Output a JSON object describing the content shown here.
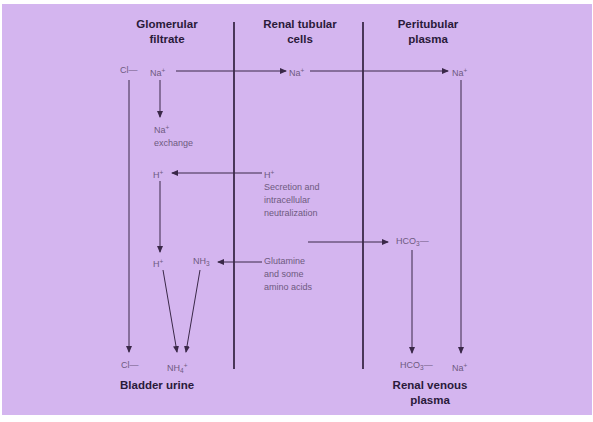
{
  "columns": {
    "glomerular": "Glomerular filtrate",
    "glomerular_l1": "Glomerular",
    "glomerular_l2": "filtrate",
    "tubular_l1": "Renal tubular",
    "tubular_l2": "cells",
    "peritubular_l1": "Peritubular",
    "peritubular_l2": "plasma"
  },
  "footers": {
    "bladder": "Bladder urine",
    "venous_l1": "Renal venous",
    "venous_l2": "plasma"
  },
  "species": {
    "cl_top": "Cl",
    "cl_top_charge": "—",
    "na_filtrate": "Na",
    "na_filtrate_charge": "+",
    "na_cell": "Na",
    "na_cell_charge": "+",
    "na_plasma": "Na",
    "na_plasma_charge": "+",
    "na_exchange": "Na",
    "na_exchange_charge": "+",
    "na_exchange_text": "exchange",
    "h_filtrate": "H",
    "h_filtrate_charge": "+",
    "h_cell": "H",
    "h_cell_charge": "+",
    "secretion_l1": "Secretion and",
    "secretion_l2": "intracellular",
    "secretion_l3": "neutralization",
    "h_lower": "H",
    "h_lower_charge": "+",
    "nh3": "NH",
    "nh3_sub": "3",
    "glutamine_l1": "Glutamine",
    "glutamine_l2": "and some",
    "glutamine_l3": "amino acids",
    "hco3_plasma": "HCO",
    "hco3_plasma_sub": "3",
    "hco3_plasma_charge": "—",
    "cl_bottom": "Cl",
    "cl_bottom_charge": "—",
    "nh4": "NH",
    "nh4_sub": "4",
    "nh4_charge": "+",
    "hco3_venous": "HCO",
    "hco3_venous_sub": "3",
    "hco3_venous_charge": "—",
    "na_venous": "Na",
    "na_venous_charge": "+"
  },
  "colors": {
    "background": "#d4b5ef",
    "line": "#3a2848",
    "label": "#6e5a80",
    "heading": "#2a1a3a"
  }
}
